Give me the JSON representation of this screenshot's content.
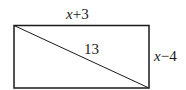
{
  "diagram": {
    "type": "rectangle-with-diagonal",
    "top_label": {
      "var": "x",
      "rest": "+3"
    },
    "right_label": {
      "var": "x",
      "rest": "−4"
    },
    "diagonal_label": "13"
  }
}
